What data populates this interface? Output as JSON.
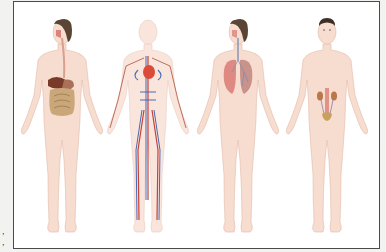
{
  "image": {
    "description": "Anatomical illustration of four human figures showing body systems",
    "figures": [
      {
        "system": "digestive",
        "center_x": 62,
        "organs": [
          "esophagus",
          "liver",
          "stomach",
          "small-intestine",
          "large-intestine"
        ]
      },
      {
        "system": "circulatory",
        "center_x": 148,
        "organs": [
          "heart",
          "arteries",
          "veins"
        ]
      },
      {
        "system": "respiratory",
        "center_x": 238,
        "organs": [
          "trachea",
          "lungs"
        ]
      },
      {
        "system": "urinary",
        "center_x": 327,
        "organs": [
          "kidneys",
          "ureters",
          "bladder"
        ]
      }
    ],
    "colors": {
      "skin": "#f7dcd0",
      "skin_outline": "#e3bba8",
      "hair": "#5a4434",
      "artery": "#c8362a",
      "vein": "#3f62b0",
      "lung": "#de8a82",
      "liver": "#7a3a2a",
      "intestine": "#c9a778",
      "kidney": "#b9774a",
      "frame": "#4a4a4a"
    }
  },
  "margin_marks": [
    ",",
    ","
  ]
}
